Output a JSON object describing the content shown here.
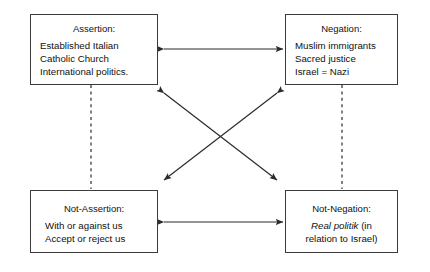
{
  "diagram": {
    "type": "semiotic-square",
    "boxes": [
      {
        "id": "assertion",
        "position": "top-left",
        "title": "Assertion:",
        "lines": [
          "Established Italian",
          "Catholic Church",
          "International politics."
        ]
      },
      {
        "id": "negation",
        "position": "top-right",
        "title": "Negation:",
        "lines": [
          "Muslim immigrants",
          "Sacred justice",
          "Israel = Nazi"
        ]
      },
      {
        "id": "not-assertion",
        "position": "bottom-left",
        "title": "Not-Assertion:",
        "lines": [
          "With or against us",
          "Accept or reject us"
        ]
      },
      {
        "id": "not-negation",
        "position": "bottom-right",
        "title": "Not-Negation:",
        "lines_rich": [
          {
            "italic": "Real politik",
            "plain": " (in"
          },
          {
            "italic": "",
            "plain": "relation to Israel)"
          }
        ]
      }
    ],
    "connectors": [
      {
        "id": "top-horizontal",
        "from": "assertion",
        "to": "negation",
        "style": "solid",
        "heads": "both"
      },
      {
        "id": "bottom-horizontal",
        "from": "not-assertion",
        "to": "not-negation",
        "style": "solid",
        "heads": "both"
      },
      {
        "id": "diagonal-assertion-notnegation",
        "from": "assertion",
        "to": "not-negation",
        "style": "solid",
        "heads": "both"
      },
      {
        "id": "diagonal-negation-notassertion",
        "from": "negation",
        "to": "not-assertion",
        "style": "solid",
        "heads": "both"
      },
      {
        "id": "left-vertical",
        "from": "assertion",
        "to": "not-assertion",
        "style": "dashed",
        "heads": "none"
      },
      {
        "id": "right-vertical",
        "from": "negation",
        "to": "not-negation",
        "style": "dashed",
        "heads": "none"
      }
    ],
    "colors": {
      "line": "#2b2b2b",
      "border": "#3b3b3b",
      "text": "#111111",
      "background": "#ffffff"
    }
  }
}
